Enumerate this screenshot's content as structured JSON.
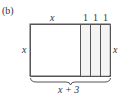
{
  "figure": {
    "part_label": "(b)",
    "top_labels": {
      "main": "x",
      "strips": [
        "1",
        "1",
        "1"
      ]
    },
    "left_label": "x",
    "right_label": "x",
    "bottom_label": "x + 3",
    "colors": {
      "stroke": "#555555",
      "strip_fill": "#f4f4f4",
      "background": "#ffffff"
    }
  }
}
